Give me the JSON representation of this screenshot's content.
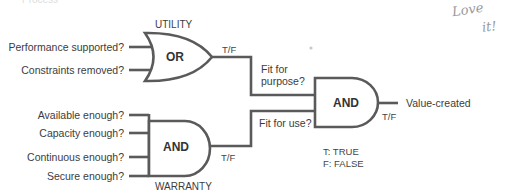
{
  "header_cutoff": "Process",
  "handwritten_note": {
    "line1": "Love",
    "line2": "it!"
  },
  "utility": {
    "group_label": "UTILITY",
    "gate": "OR",
    "inputs": [
      "Performance supported?",
      "Constraints removed?"
    ],
    "output_label": "T/F",
    "result_label_line1": "Fit for",
    "result_label_line2": "purpose?"
  },
  "warranty": {
    "group_label": "WARRANTY",
    "gate": "AND",
    "inputs": [
      "Available enough?",
      "Capacity enough?",
      "Continuous enough?",
      "Secure enough?"
    ],
    "output_label": "T/F",
    "result_label": "Fit for use?"
  },
  "value": {
    "gate": "AND",
    "output_label": "T/F",
    "result": "Value-created"
  },
  "legend": {
    "t": "T: TRUE",
    "f": "F: FALSE"
  },
  "colors": {
    "line": "#5a5a5a",
    "text": "#3a3a3a"
  }
}
